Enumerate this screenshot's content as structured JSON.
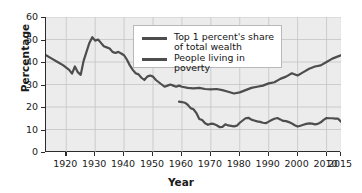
{
  "chart_data": {
    "type": "line",
    "title": "",
    "xlabel": "Year",
    "ylabel": "Percentage",
    "xlim": [
      1913,
      2015
    ],
    "ylim": [
      0,
      60
    ],
    "grid": true,
    "legend_position": "top-center",
    "xticks": [
      1920,
      1930,
      1940,
      1950,
      1960,
      1970,
      1980,
      1990,
      2000,
      2010,
      2015
    ],
    "yticks": [
      0,
      10,
      20,
      30,
      40,
      50,
      60
    ],
    "series": [
      {
        "name": "Top 1 percent's share of total wealth",
        "color": "#4d4d4d",
        "x": [
          1913,
          1915,
          1917,
          1919,
          1921,
          1922,
          1923,
          1924,
          1925,
          1926,
          1927,
          1928,
          1929,
          1930,
          1931,
          1932,
          1933,
          1934,
          1935,
          1936,
          1937,
          1938,
          1939,
          1940,
          1941,
          1942,
          1943,
          1944,
          1945,
          1946,
          1947,
          1948,
          1949,
          1950,
          1951,
          1952,
          1953,
          1954,
          1955,
          1956,
          1957,
          1958,
          1959,
          1960,
          1962,
          1964,
          1966,
          1968,
          1970,
          1972,
          1974,
          1976,
          1978,
          1980,
          1982,
          1984,
          1986,
          1988,
          1990,
          1992,
          1994,
          1996,
          1998,
          2000,
          2002,
          2004,
          2006,
          2008,
          2010,
          2012,
          2014,
          2015
        ],
        "y": [
          43.0,
          41.5,
          40.0,
          38.5,
          36.5,
          34.8,
          38.0,
          35.5,
          34.3,
          40.5,
          44.5,
          48.5,
          51.0,
          49.5,
          50.0,
          48.5,
          47.0,
          46.5,
          46.0,
          44.5,
          44.0,
          44.5,
          43.8,
          43.0,
          41.0,
          38.5,
          36.5,
          35.0,
          34.5,
          33.0,
          32.0,
          33.5,
          34.0,
          33.5,
          32.0,
          31.0,
          30.0,
          29.0,
          29.5,
          30.0,
          29.5,
          29.0,
          29.5,
          29.0,
          28.5,
          28.3,
          28.5,
          28.0,
          27.8,
          28.0,
          27.5,
          26.8,
          26.0,
          26.5,
          27.5,
          28.5,
          29.0,
          29.5,
          30.5,
          31.0,
          32.5,
          33.5,
          35.0,
          34.0,
          35.5,
          37.0,
          38.0,
          38.5,
          40.0,
          41.5,
          42.5,
          43.0
        ]
      },
      {
        "name": "People living in poverty",
        "color": "#4d4d4d",
        "x": [
          1959,
          1960,
          1961,
          1962,
          1963,
          1964,
          1965,
          1966,
          1967,
          1968,
          1969,
          1970,
          1971,
          1972,
          1973,
          1974,
          1975,
          1976,
          1977,
          1978,
          1979,
          1980,
          1981,
          1982,
          1983,
          1984,
          1985,
          1986,
          1987,
          1988,
          1989,
          1990,
          1991,
          1992,
          1993,
          1994,
          1995,
          1996,
          1997,
          1998,
          1999,
          2000,
          2001,
          2002,
          2003,
          2004,
          2005,
          2006,
          2007,
          2008,
          2009,
          2010,
          2011,
          2012,
          2013,
          2014,
          2015
        ],
        "y": [
          22.4,
          22.2,
          21.9,
          21.0,
          19.5,
          19.0,
          17.3,
          14.7,
          14.2,
          12.8,
          12.1,
          12.6,
          12.5,
          11.9,
          11.1,
          11.2,
          12.3,
          11.8,
          11.6,
          11.4,
          11.7,
          13.0,
          14.0,
          15.0,
          15.2,
          14.4,
          14.0,
          13.6,
          13.4,
          13.0,
          12.8,
          13.5,
          14.2,
          14.8,
          15.1,
          14.5,
          13.8,
          13.7,
          13.3,
          12.7,
          11.9,
          11.3,
          11.7,
          12.1,
          12.5,
          12.7,
          12.6,
          12.3,
          12.5,
          13.2,
          14.3,
          15.1,
          15.0,
          15.0,
          14.8,
          14.8,
          13.5
        ]
      }
    ]
  },
  "axes": {
    "ylabel": "Percentage",
    "xlabel": "Year",
    "yticks": [
      "60",
      "50",
      "40",
      "30",
      "20",
      "10",
      "0"
    ],
    "xticks": [
      "1920",
      "1930",
      "1940",
      "1950",
      "1960",
      "1970",
      "1980",
      "1990",
      "2000",
      "2010",
      "2015"
    ]
  },
  "legend": {
    "entries": [
      {
        "label": "Top 1 percent's share\nof total wealth"
      },
      {
        "label": "People living in poverty"
      }
    ]
  }
}
